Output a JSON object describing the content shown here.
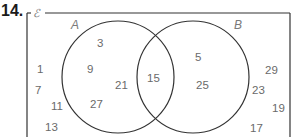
{
  "question_number": "14.",
  "universal_set_symbol": "ℰ",
  "sets": [
    {
      "label": "A",
      "cx": 118,
      "cy": 77,
      "r": 56
    },
    {
      "label": "B",
      "cx": 193,
      "cy": 77,
      "r": 56
    }
  ],
  "regions": {
    "A_only": [
      "3",
      "9",
      "21",
      "27"
    ],
    "A_and_B": [
      "15"
    ],
    "B_only": [
      "5",
      "25"
    ],
    "outside": [
      "1",
      "7",
      "11",
      "13",
      "29",
      "23",
      "19",
      "17"
    ]
  },
  "elements": [
    {
      "value": "3",
      "x": 97,
      "y": 47,
      "region": "A_only"
    },
    {
      "value": "9",
      "x": 87,
      "y": 73,
      "region": "A_only"
    },
    {
      "value": "21",
      "x": 115,
      "y": 89,
      "region": "A_only"
    },
    {
      "value": "27",
      "x": 90,
      "y": 108,
      "region": "A_only"
    },
    {
      "value": "15",
      "x": 147,
      "y": 82,
      "region": "A_and_B"
    },
    {
      "value": "5",
      "x": 195,
      "y": 61,
      "region": "B_only"
    },
    {
      "value": "25",
      "x": 196,
      "y": 89,
      "region": "B_only"
    },
    {
      "value": "1",
      "x": 37,
      "y": 73,
      "region": "outside"
    },
    {
      "value": "7",
      "x": 35,
      "y": 94,
      "region": "outside"
    },
    {
      "value": "11",
      "x": 51,
      "y": 110,
      "region": "outside"
    },
    {
      "value": "13",
      "x": 45,
      "y": 131,
      "region": "outside"
    },
    {
      "value": "29",
      "x": 265,
      "y": 74,
      "region": "outside"
    },
    {
      "value": "23",
      "x": 252,
      "y": 94,
      "region": "outside"
    },
    {
      "value": "19",
      "x": 272,
      "y": 112,
      "region": "outside"
    },
    {
      "value": "17",
      "x": 250,
      "y": 132,
      "region": "outside"
    }
  ]
}
